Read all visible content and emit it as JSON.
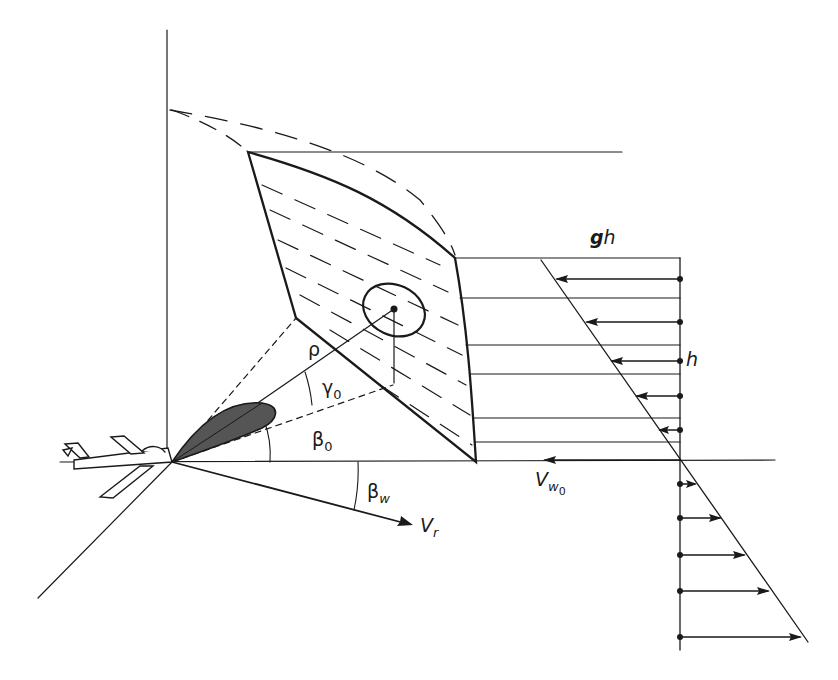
{
  "diagram": {
    "labels": {
      "rho": "ρ",
      "gamma": "γ",
      "gamma_sub": "0",
      "beta0": "β",
      "beta0_sub": "0",
      "betaw": "β",
      "betaw_sub": "w",
      "vr": "V",
      "vr_sub": "r",
      "vw0": "V",
      "vw0_sub": "w",
      "vw0_subsub": "0",
      "gh_g": "g",
      "gh_h": "h",
      "h": "h"
    },
    "colors": {
      "line": "#1a1a1a",
      "beam_fill": "#555555",
      "background": "#ffffff"
    }
  }
}
